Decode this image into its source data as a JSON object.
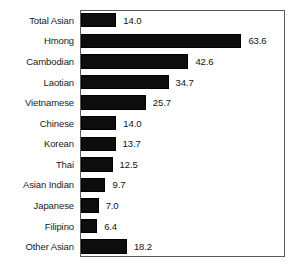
{
  "chart_data": {
    "type": "bar",
    "orientation": "horizontal",
    "title": "",
    "subtitle": "",
    "xlabel": "",
    "ylabel": "",
    "categories": [
      "Total Asian",
      "Hmong",
      "Cambodian",
      "Laotian",
      "Vietnamese",
      "Chinese",
      "Korean",
      "Thai",
      "Asian Indian",
      "Japanese",
      "Filipino",
      "Other Asian"
    ],
    "values": [
      14.0,
      63.6,
      42.6,
      34.7,
      25.7,
      14.0,
      13.7,
      12.5,
      9.7,
      7.0,
      6.4,
      18.2
    ],
    "value_labels": [
      "14.0",
      "63.6",
      "42.6",
      "34.7",
      "25.7",
      "14.0",
      "13.7",
      "12.5",
      "9.7",
      "7.0",
      "6.4",
      "18.2"
    ],
    "xlim": [
      0,
      80.5
    ],
    "grid": false,
    "legend": false,
    "legend_position": "none",
    "bar_color": "#0d0d0d",
    "frame_color": "#5a5a5a",
    "background_color": "#ffffff",
    "axis_ticks": []
  }
}
